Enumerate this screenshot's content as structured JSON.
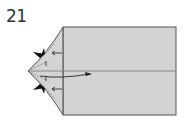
{
  "diagram": {
    "step_number": "21",
    "paper_color": "#d4d4d4",
    "outline_color": "#555555",
    "arrow_color": "#222222",
    "shapes": {
      "rectangle": {
        "x": 63,
        "y": 27,
        "w": 113,
        "h": 88
      },
      "point_tip": {
        "x": 28,
        "y": 71
      },
      "center_line_y": 71
    },
    "annotations": [
      "squash-fold-arrow-top",
      "squash-fold-arrow-bottom",
      "push-arrow-right",
      "inside-reverse-fold-arrows"
    ]
  }
}
